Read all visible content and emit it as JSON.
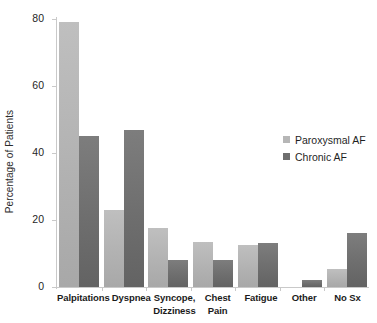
{
  "chart_data": {
    "type": "bar",
    "title": "",
    "xlabel": "",
    "ylabel": "Percentage of Patients",
    "ylim": [
      0,
      80
    ],
    "yticks": [
      0,
      20,
      40,
      60,
      80
    ],
    "ytick_labels": [
      "0",
      "20",
      "40",
      "60",
      "80"
    ],
    "grid": false,
    "legend_position": "center-right",
    "categories": [
      "Palpitations",
      "Syncope, Dizziness",
      "Dyspnea",
      "Chest Pain",
      "Fatigue",
      "Other",
      "No Sx"
    ],
    "category_labels": [
      {
        "line1": "Palpitations",
        "line2": ""
      },
      {
        "line1": "Dyspnea",
        "line2": ""
      },
      {
        "line1": "Syncope,",
        "line2": "Dizziness"
      },
      {
        "line1": "Chest Pain",
        "line2": ""
      },
      {
        "line1": "Fatigue",
        "line2": ""
      },
      {
        "line1": "Other",
        "line2": ""
      },
      {
        "line1": "No Sx",
        "line2": ""
      }
    ],
    "series": [
      {
        "name": "Paroxysmal AF",
        "color": "#b6b6b6",
        "values": [
          79,
          23,
          17.5,
          13.5,
          12.5,
          0,
          5.5
        ]
      },
      {
        "name": "Chronic AF",
        "color": "#6e6e6e",
        "values": [
          45,
          47,
          8,
          8,
          13,
          2,
          16
        ]
      }
    ]
  },
  "legend": {
    "items": [
      {
        "label": "Paroxysmal AF"
      },
      {
        "label": "Chronic AF"
      }
    ]
  }
}
